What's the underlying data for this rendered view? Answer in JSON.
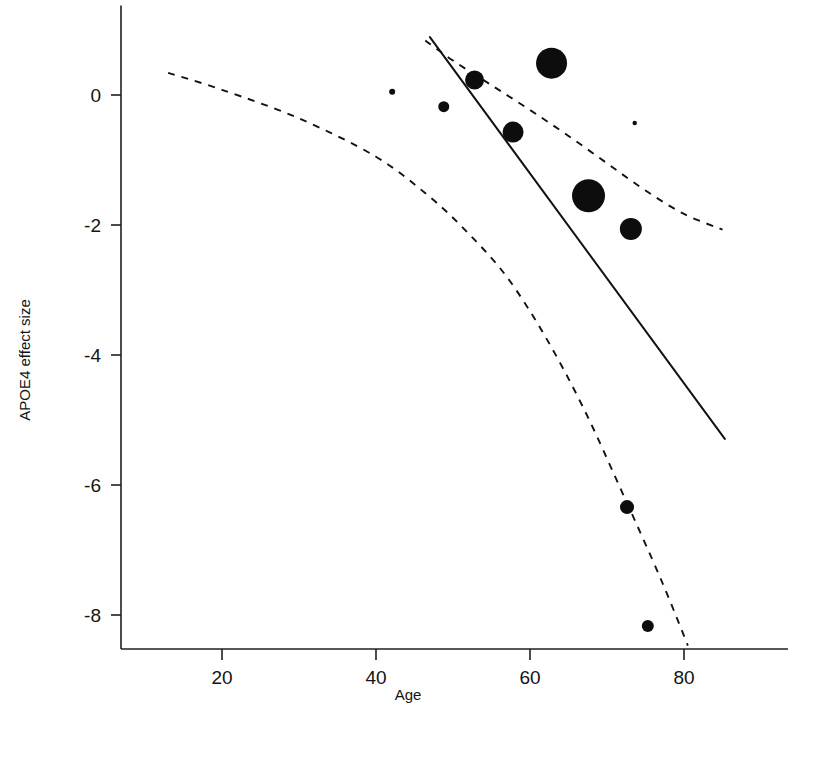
{
  "chart_data": {
    "type": "scatter",
    "title": "",
    "subtitle": "",
    "xlabel": "Age",
    "ylabel": "APOE4 effect size",
    "xlim": [
      10,
      92
    ],
    "ylim": [
      -8.5,
      1.1
    ],
    "grid": false,
    "legend": null,
    "x_ticks": [
      20,
      40,
      60,
      80
    ],
    "x_tick_labels": [
      "20",
      "40",
      "60",
      "80"
    ],
    "y_ticks": [
      0,
      -2,
      -4,
      -6,
      -8
    ],
    "y_tick_labels": [
      "0",
      "-2",
      "-4",
      "-6",
      "-8"
    ],
    "point_size_meaning": "study weight / precision (bubble area)",
    "points": [
      {
        "x": 42.1,
        "y": 0.05,
        "size": 3
      },
      {
        "x": 48.8,
        "y": -0.18,
        "size": 5.5
      },
      {
        "x": 52.8,
        "y": 0.23,
        "size": 9.5
      },
      {
        "x": 57.8,
        "y": -0.57,
        "size": 10.5
      },
      {
        "x": 62.8,
        "y": 0.49,
        "size": 15.5
      },
      {
        "x": 73.6,
        "y": -0.43,
        "size": 2.2
      },
      {
        "x": 67.6,
        "y": -1.55,
        "size": 16.5
      },
      {
        "x": 73.1,
        "y": -2.06,
        "size": 11.0
      },
      {
        "x": 72.6,
        "y": -6.34,
        "size": 7.0
      },
      {
        "x": 75.3,
        "y": -8.17,
        "size": 6.0
      }
    ],
    "fit_line": {
      "style": "solid",
      "label": "meta-regression fit",
      "points": [
        [
          47.0,
          0.89
        ],
        [
          85.3,
          -5.29
        ]
      ]
    },
    "confidence_bands": [
      {
        "style": "dashed",
        "label": "upper 95% confidence limit",
        "points": [
          [
            46.4,
            0.84
          ],
          [
            50.0,
            0.53
          ],
          [
            55.0,
            0.15
          ],
          [
            60.0,
            -0.23
          ],
          [
            65.0,
            -0.63
          ],
          [
            70.0,
            -1.05
          ],
          [
            75.0,
            -1.47
          ],
          [
            80.0,
            -1.83
          ],
          [
            85.0,
            -2.07
          ]
        ]
      },
      {
        "style": "dashed",
        "label": "lower 95% confidence limit",
        "points": [
          [
            13.0,
            0.34
          ],
          [
            20.0,
            0.08
          ],
          [
            30.0,
            -0.36
          ],
          [
            40.0,
            -0.95
          ],
          [
            47.0,
            -1.57
          ],
          [
            52.0,
            -2.13
          ],
          [
            57.0,
            -2.8
          ],
          [
            62.0,
            -3.72
          ],
          [
            67.0,
            -4.83
          ],
          [
            72.0,
            -6.12
          ],
          [
            77.0,
            -7.45
          ],
          [
            80.5,
            -8.47
          ]
        ]
      }
    ]
  },
  "axis": {
    "x_title": "Age",
    "y_title": "APOE4 effect size"
  }
}
